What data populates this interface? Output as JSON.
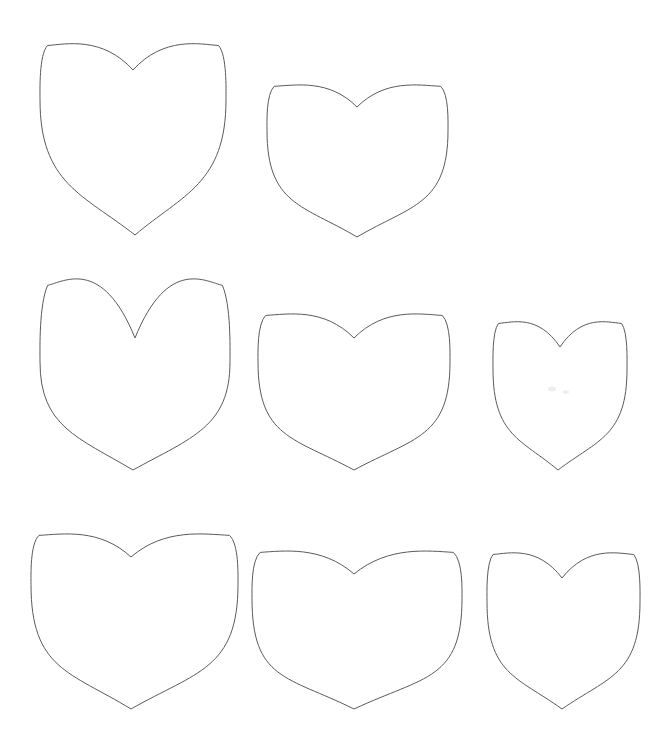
{
  "canvas": {
    "width": 666,
    "height": 756,
    "background_color": "#ffffff",
    "title": "Heart Shape Template Sheet"
  },
  "style": {
    "stroke_color": "#5a5a5a",
    "fill_color": "#ffffff",
    "stroke_width": 1,
    "smudge_color": "#ededf0"
  },
  "shapes": {
    "kind": "heart-outline",
    "count": 8,
    "rows": 3,
    "items": [
      {
        "id": "heart-r1c1",
        "label": "Heart 1 - large tall pointed",
        "row": 1,
        "col": 1,
        "left": 40,
        "top": 44,
        "width": 186,
        "height": 191,
        "center_x": 133,
        "cleft_y": 70,
        "tip_x": 135,
        "tip_y": 235,
        "lobe_spread": 0.97,
        "lobe_rise": 0.3,
        "waist": 0.62,
        "taper": 0.3
      },
      {
        "id": "heart-r1c2",
        "label": "Heart 2 - wide rounded",
        "row": 1,
        "col": 2,
        "left": 267,
        "top": 85,
        "width": 181,
        "height": 152,
        "center_x": 357,
        "cleft_y": 107,
        "tip_x": 357,
        "tip_y": 237,
        "lobe_spread": 0.9,
        "lobe_rise": 0.26,
        "waist": 0.7,
        "taper": 0.26
      },
      {
        "id": "heart-r2c1",
        "label": "Heart 3 - narrow tall deep cleft",
        "row": 2,
        "col": 1,
        "left": 40,
        "top": 282,
        "width": 190,
        "height": 188,
        "center_x": 135,
        "cleft_y": 338,
        "tip_x": 133,
        "tip_y": 470,
        "lobe_spread": 1.02,
        "lobe_rise": 0.46,
        "waist": 0.6,
        "taper": 0.26
      },
      {
        "id": "heart-r2c2",
        "label": "Heart 4 - wide rounded medium",
        "row": 2,
        "col": 2,
        "left": 258,
        "top": 314,
        "width": 192,
        "height": 156,
        "center_x": 354,
        "cleft_y": 338,
        "tip_x": 354,
        "tip_y": 470,
        "lobe_spread": 0.92,
        "lobe_rise": 0.26,
        "waist": 0.7,
        "taper": 0.24
      },
      {
        "id": "heart-r2c3",
        "label": "Heart 5 - small narrow",
        "row": 2,
        "col": 3,
        "left": 493,
        "top": 322,
        "width": 134,
        "height": 148,
        "center_x": 560,
        "cleft_y": 347,
        "tip_x": 558,
        "tip_y": 470,
        "lobe_spread": 0.95,
        "lobe_rise": 0.3,
        "waist": 0.66,
        "taper": 0.28
      },
      {
        "id": "heart-r3c1",
        "label": "Heart 6 - large rounded",
        "row": 3,
        "col": 1,
        "left": 31,
        "top": 534,
        "width": 207,
        "height": 175,
        "center_x": 131,
        "cleft_y": 557,
        "tip_x": 131,
        "tip_y": 709,
        "lobe_spread": 0.92,
        "lobe_rise": 0.26,
        "waist": 0.68,
        "taper": 0.25
      },
      {
        "id": "heart-r3c2",
        "label": "Heart 7 - wide flat broad",
        "row": 3,
        "col": 2,
        "left": 252,
        "top": 551,
        "width": 210,
        "height": 158,
        "center_x": 354,
        "cleft_y": 574,
        "tip_x": 354,
        "tip_y": 709,
        "lobe_spread": 0.94,
        "lobe_rise": 0.24,
        "waist": 0.74,
        "taper": 0.22
      },
      {
        "id": "heart-r3c3",
        "label": "Heart 8 - medium upright",
        "row": 3,
        "col": 3,
        "left": 487,
        "top": 553,
        "width": 153,
        "height": 156,
        "center_x": 562,
        "cleft_y": 578,
        "tip_x": 562,
        "tip_y": 709,
        "lobe_spread": 0.95,
        "lobe_rise": 0.28,
        "waist": 0.68,
        "taper": 0.26
      }
    ]
  },
  "artifacts": [
    {
      "id": "smudge-1",
      "label": "faint gray speck inside heart 5",
      "cx": 552,
      "cy": 389,
      "rx": 4,
      "ry": 2.5
    },
    {
      "id": "smudge-2",
      "label": "faint gray speck inside heart 5",
      "cx": 566,
      "cy": 392,
      "rx": 3,
      "ry": 1.8
    }
  ]
}
